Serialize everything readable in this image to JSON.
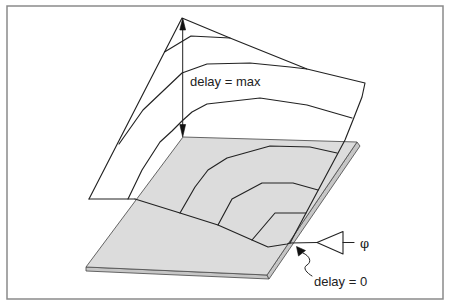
{
  "figure": {
    "labels": {
      "delay_max": "delay = max",
      "delay_zero": "delay = 0",
      "phase_symbol": "φ"
    },
    "colors": {
      "background": "#ffffff",
      "frame": "#8a8a8a",
      "line": "#222222",
      "plane_top": "#dcdcdc",
      "plane_side": "#c6c6c6",
      "sheet": "#ffffff"
    },
    "geometry": {
      "frame": "7,6 443,6 443,299 7,299",
      "sheet_fill": "89,199 182,18 230,38 307,69 365,83 362,97 353,120 347,141 183,137 135,199",
      "plane_top": "183,137 357,142 267,275 86,267",
      "plane_side_bottom": "86,267 267,275 269,279 86,271",
      "plane_side_right": "357,142 360,146 269,279 267,275",
      "sheet_outline": "89,199 182,18 230,38 307,69 365,83 362,97 353,120 345,140 290,243",
      "sheet_bottom_white": "89,199 135,199",
      "sheet_bottom_plane": "135,199 180,213 218,225 252,240 268,247 287,244 290,243",
      "contours": [
        "164.5,52 191,36 230,38",
        "119,144 143,110 182,73 207,64 250,63 290,67 307,69",
        "128,199 142,170 160,142 172,131 182,121 192,112 207,104 260,98 307,105 352,118",
        "180,213 195,187 208,170 227,158 270,146 310,147 337,153",
        "218,225 232,199 262,183 293,183 318,190",
        "252,240 275,213 306,213"
      ],
      "height_arrow": {
        "shaft": "182.7,26 182.7,128",
        "head_top": "182.7,18 179.8,30 185.6,30",
        "head_bottom": "182.7,137 179.8,124.5 185.6,124.5"
      },
      "zero_pointer": {
        "head": "296.5,246.5 298.5,256 305.5,250.5",
        "tail": "M303,253 C 310,256 312,262 307,265 C 302,268 307,273 312,276"
      },
      "driver": {
        "input_wire": "290,243 317,242.5",
        "triangle": "317,242.5 343,231.5 343,254",
        "output_wire": "343,242.5 354,242.5"
      }
    }
  }
}
